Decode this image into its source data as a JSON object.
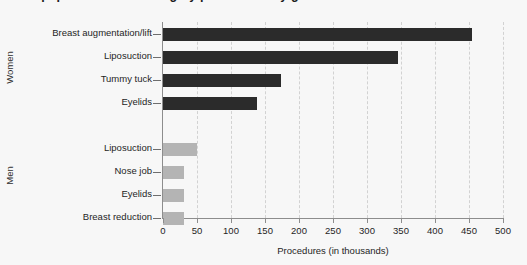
{
  "chart_data": {
    "type": "bar",
    "orientation": "horizontal",
    "title": "Most popular cosmetic surgery procedures by gender",
    "xlabel": "Procedures (in thousands)",
    "ylabel": "",
    "xlim": [
      0,
      500
    ],
    "xticks": [
      0,
      50,
      100,
      150,
      200,
      250,
      300,
      350,
      400,
      450,
      500
    ],
    "grid": "vertical-dashed",
    "legend": "none",
    "groups": [
      {
        "name": "Women",
        "color": "#2b2b2b",
        "categories": [
          "Breast augmentation/lift",
          "Liposuction",
          "Tummy tuck",
          "Eyelids"
        ],
        "values": [
          455,
          345,
          173,
          138
        ]
      },
      {
        "name": "Men",
        "color": "#b4b4b4",
        "categories": [
          "Liposuction",
          "Nose job",
          "Eyelids",
          "Breast reduction"
        ],
        "values": [
          50,
          31,
          31,
          31
        ]
      }
    ]
  },
  "colors": {
    "women_bar": "#2b2b2b",
    "men_bar": "#b4b4b4",
    "background": "#f7f7f7",
    "gridline": "#d2d2d2",
    "axis": "#8d8d8d",
    "text": "#252525"
  }
}
